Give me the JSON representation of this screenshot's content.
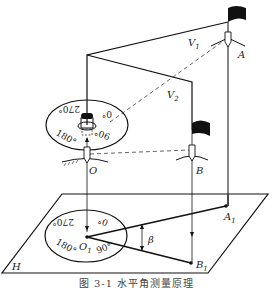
{
  "figure": {
    "caption": "图 3-1   水平角测量原理",
    "points": {
      "A": "A",
      "B": "B",
      "O": "O",
      "A1": "A",
      "A1_sub": "1",
      "B1": "B",
      "B1_sub": "1",
      "O1": "O",
      "O1_sub": "1"
    },
    "planes": {
      "V1": "V",
      "V1_sub": "1",
      "V2": "V",
      "V2_sub": "2",
      "H": "H"
    },
    "angle_label": "β",
    "instrument_dial": {
      "labels": [
        "0°",
        "90°",
        "180°",
        "270°"
      ]
    },
    "projected_dial": {
      "labels": [
        "0°",
        "90°",
        "180°",
        "270°"
      ]
    },
    "colors": {
      "line": "#111111",
      "dashed": "#555555",
      "text": "#222222",
      "caption": "#444444"
    }
  }
}
